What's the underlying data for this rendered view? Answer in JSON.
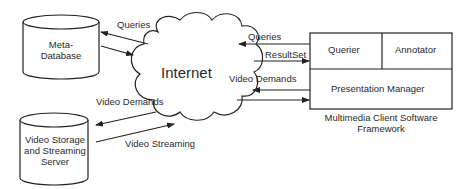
{
  "diagram": {
    "nodes": {
      "meta_database": {
        "label_line1": "Meta-",
        "label_line2": "Database",
        "shape": "cylinder"
      },
      "video_server": {
        "label_line1": "Video Storage",
        "label_line2": "and Streaming",
        "label_line3": "Server",
        "shape": "cylinder"
      },
      "internet": {
        "label": "Internet",
        "shape": "cloud"
      },
      "client": {
        "querier": "Querier",
        "annotator": "Annotator",
        "presentation_manager": "Presentation Manager",
        "caption_line1": "Multimedia Client Software",
        "caption_line2": "Framework"
      }
    },
    "edges": {
      "queries_left": "Queries",
      "video_demands_left": "Video Demands",
      "video_streaming": "Video Streaming",
      "queries_right": "Queries",
      "resultset": "ResultSet",
      "video_demands_right": "Video Demands"
    },
    "colors": {
      "stroke": "#222222",
      "background": "#ffffff"
    }
  }
}
